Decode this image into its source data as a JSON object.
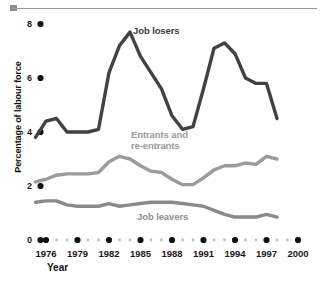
{
  "chart_data": {
    "type": "line",
    "title": "",
    "xlabel": "Year",
    "ylabel": "Percentage of labour force",
    "xlim": [
      1975,
      2000
    ],
    "ylim": [
      0,
      8
    ],
    "grid": false,
    "legend_position": "inline-annotations",
    "y_ticks": [
      0,
      2,
      4,
      6,
      8
    ],
    "y_tick_labels": [
      "0",
      "2",
      "4",
      "6",
      "8"
    ],
    "x_ticks": [
      1976,
      1979,
      1982,
      1985,
      1988,
      1991,
      1994,
      1997,
      2000
    ],
    "x_tick_labels": [
      "1976",
      "1979",
      "1982",
      "1985",
      "1988",
      "1991",
      "1994",
      "1997",
      "2000"
    ],
    "x_minor_ticks": [
      1977,
      1978,
      1980,
      1981,
      1983,
      1984,
      1986,
      1987,
      1989,
      1990,
      1992,
      1993,
      1995,
      1996,
      1998,
      1999
    ],
    "x": [
      1975,
      1976,
      1977,
      1978,
      1979,
      1980,
      1981,
      1982,
      1983,
      1984,
      1985,
      1986,
      1987,
      1988,
      1989,
      1990,
      1991,
      1992,
      1993,
      1994,
      1995,
      1996,
      1997,
      1998
    ],
    "series": [
      {
        "name": "Job losers",
        "color": "#424242",
        "values": [
          3.8,
          4.4,
          4.5,
          4.0,
          4.0,
          4.0,
          4.1,
          6.2,
          7.2,
          7.7,
          6.8,
          6.2,
          5.6,
          4.6,
          4.1,
          4.2,
          5.6,
          7.1,
          7.3,
          6.9,
          6.0,
          5.8,
          5.8,
          4.5
        ],
        "annotation": "Job losers"
      },
      {
        "name": "Entrants and re-entrants",
        "color": "#9b9b9b",
        "values": [
          2.15,
          2.25,
          2.4,
          2.45,
          2.45,
          2.45,
          2.5,
          2.9,
          3.1,
          3.0,
          2.75,
          2.55,
          2.5,
          2.25,
          2.05,
          2.05,
          2.3,
          2.6,
          2.75,
          2.75,
          2.85,
          2.8,
          3.1,
          3.0
        ],
        "annotation": "Entrants and re-entrants"
      },
      {
        "name": "Job leavers",
        "color": "#8a8a8a",
        "values": [
          1.4,
          1.45,
          1.45,
          1.3,
          1.25,
          1.25,
          1.25,
          1.35,
          1.25,
          1.3,
          1.35,
          1.4,
          1.4,
          1.4,
          1.35,
          1.3,
          1.25,
          1.1,
          0.95,
          0.85,
          0.85,
          0.85,
          0.95,
          0.85
        ],
        "annotation": "Job leavers"
      }
    ],
    "annotations": [
      {
        "text": "Job losers",
        "series": "Job losers"
      },
      {
        "text": "Entrants and",
        "series": "Entrants and re-entrants"
      },
      {
        "text": "re-entrants",
        "series": "Entrants and re-entrants"
      },
      {
        "text": "Job leavers",
        "series": "Job leavers"
      }
    ]
  },
  "labels": {
    "losers": "Job losers",
    "entrants_line1": "Entrants and",
    "entrants_line2": "re-entrants",
    "leavers": "Job leavers",
    "y_axis_title": "Percentage of labour force",
    "x_axis_title": "Year"
  },
  "colors": {
    "job_losers": "#424242",
    "entrants": "#9b9b9b",
    "job_leavers": "#8a8a8a",
    "axis_text": "#1a1a1a",
    "rule": "#9a9a9a"
  }
}
